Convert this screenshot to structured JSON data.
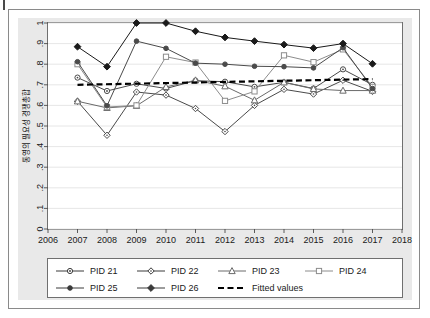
{
  "figure": {
    "background_color": "#e9e9e9",
    "plot_background_color": "#ffffff",
    "frame_color": "#6f6f6f",
    "gridline_color": "#e0e0e0"
  },
  "chart_data": {
    "type": "line",
    "title": "",
    "subtitle": "",
    "xlabel": "",
    "ylabel": "통영의 필요성 경쟁총합",
    "xlim": [
      2006,
      2018
    ],
    "ylim": [
      0,
      1
    ],
    "x_ticks": [
      "2006",
      "2007",
      "2008",
      "2009",
      "2010",
      "2011",
      "2012",
      "2013",
      "2014",
      "2015",
      "2016",
      "2017",
      "2018"
    ],
    "y_ticks": [
      "0",
      ".1",
      ".2",
      ".3",
      ".4",
      ".5",
      ".6",
      ".7",
      ".8",
      ".9",
      "1"
    ],
    "grid": true,
    "grid_axis": "y",
    "legend_position": "bottom",
    "x": [
      2007,
      2008,
      2009,
      2010,
      2011,
      2012,
      2013,
      2014,
      2015,
      2016,
      2017
    ],
    "series": [
      {
        "name": "PID 21",
        "marker": "circle-open",
        "color": "#4a4a4a",
        "values": [
          0.735,
          0.67,
          0.705,
          0.682,
          0.72,
          0.715,
          0.69,
          0.712,
          0.682,
          0.775,
          0.7
        ]
      },
      {
        "name": "PID 22",
        "marker": "diamond-open",
        "color": "#4a4a4a",
        "values": [
          0.62,
          0.455,
          0.665,
          0.65,
          0.585,
          0.473,
          0.6,
          0.678,
          0.655,
          0.722,
          0.668
        ]
      },
      {
        "name": "PID 23",
        "marker": "triangle-open",
        "color": "#6a6a6a",
        "values": [
          0.62,
          0.588,
          0.598,
          0.69,
          0.722,
          0.693,
          0.625,
          0.712,
          0.68,
          0.672,
          0.672
        ]
      },
      {
        "name": "PID 24",
        "marker": "square-open",
        "color": "#8c8c8c",
        "values": [
          0.8,
          0.592,
          0.6,
          0.836,
          0.808,
          0.622,
          0.668,
          0.843,
          0.81,
          0.872,
          0.69
        ]
      },
      {
        "name": "PID 25",
        "marker": "circle-filled",
        "color": "#4a4a4a",
        "values": [
          0.812,
          0.598,
          0.912,
          0.877,
          0.805,
          0.8,
          0.79,
          0.788,
          0.782,
          0.88,
          0.682
        ]
      },
      {
        "name": "PID 26",
        "marker": "diamond-filled",
        "color": "#1a1a1a",
        "values": [
          0.885,
          0.788,
          1.0,
          1.0,
          0.96,
          0.93,
          0.912,
          0.895,
          0.878,
          0.9,
          0.802
        ]
      }
    ],
    "fitted": {
      "name": "Fitted values",
      "style": "dashed",
      "color": "#000000",
      "x": [
        2007,
        2017
      ],
      "values": [
        0.7,
        0.728
      ]
    }
  },
  "legend": {
    "items": [
      {
        "label": "PID 21",
        "marker": "circle-open"
      },
      {
        "label": "PID 22",
        "marker": "diamond-open"
      },
      {
        "label": "PID 23",
        "marker": "triangle-open"
      },
      {
        "label": "PID 24",
        "marker": "square-open"
      },
      {
        "label": "PID 25",
        "marker": "circle-filled"
      },
      {
        "label": "PID 26",
        "marker": "diamond-filled"
      },
      {
        "label": "Fitted values",
        "marker": "dashed-line"
      }
    ]
  }
}
